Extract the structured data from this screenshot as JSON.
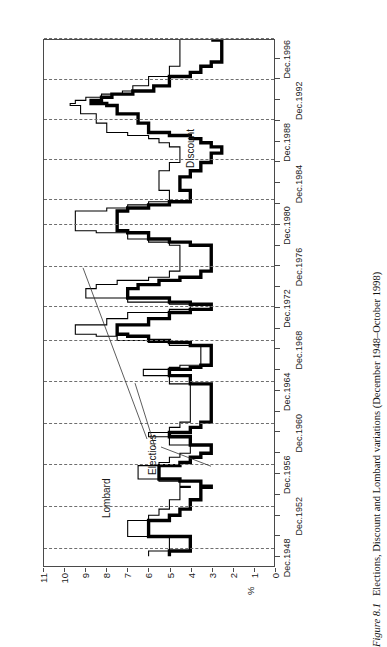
{
  "caption": {
    "figure_number": "Figure 8.1",
    "text": "Elections, Discount and Lombard variations (December 1948–October 1998)"
  },
  "annotations": {
    "lombard": "Lombard",
    "discount": "Discount",
    "elections": "Elections"
  },
  "chart_data": {
    "type": "line",
    "title": "Elections, Discount and Lombard variations (December 1948–October 1998)",
    "xlabel": "",
    "ylabel": "%",
    "ylim": [
      0,
      11
    ],
    "yticks": [
      "0",
      "1",
      "2",
      "3",
      "4",
      "5",
      "6",
      "7",
      "8",
      "9",
      "10",
      "11"
    ],
    "grid": "vertical-dashed-election-lines",
    "legend_position": "inline-annotations",
    "orientation": "page-rotated-90-ccw",
    "x_tick_labels": [
      "Dec.1948",
      "Dec.1952",
      "Dec.1956",
      "Dec.1960",
      "Dec.1964",
      "Dec.1968",
      "Dec.1972",
      "Dec.1976",
      "Dec.1980",
      "Dec.1984",
      "Dec.1988",
      "Dec.1992",
      "Dec.1996"
    ],
    "x_tick_years": [
      1948,
      1952,
      1956,
      1960,
      1964,
      1968,
      1972,
      1976,
      1980,
      1984,
      1988,
      1992,
      1996
    ],
    "x_minor_tick_years": [
      1950,
      1954,
      1958,
      1962,
      1966,
      1970,
      1974,
      1978,
      1982,
      1986,
      1990,
      1994,
      1998
    ],
    "xlim": [
      1948.0,
      1998.83
    ],
    "election_years": [
      1949.6,
      1953.7,
      1957.7,
      1961.7,
      1965.7,
      1969.7,
      1972.9,
      1976.8,
      1980.8,
      1983.2,
      1987.1,
      1990.9,
      1994.8,
      1998.75
    ],
    "series": [
      {
        "name": "Discount",
        "style": "thick-black-step",
        "points": [
          [
            1948.95,
            5.0
          ],
          [
            1949.45,
            4.0
          ],
          [
            1950.85,
            6.0
          ],
          [
            1952.4,
            5.0
          ],
          [
            1952.9,
            4.5
          ],
          [
            1953.5,
            4.0
          ],
          [
            1954.4,
            3.5
          ],
          [
            1955.6,
            3.0
          ],
          [
            1955.7,
            3.5
          ],
          [
            1956.2,
            4.5
          ],
          [
            1956.4,
            5.5
          ],
          [
            1957.7,
            4.5
          ],
          [
            1958.0,
            4.0
          ],
          [
            1958.5,
            3.5
          ],
          [
            1958.9,
            3.0
          ],
          [
            1959.7,
            4.0
          ],
          [
            1960.5,
            5.0
          ],
          [
            1960.9,
            4.0
          ],
          [
            1961.4,
            3.5
          ],
          [
            1961.9,
            3.0
          ],
          [
            1965.6,
            4.0
          ],
          [
            1966.4,
            5.0
          ],
          [
            1967.0,
            4.0
          ],
          [
            1967.2,
            3.5
          ],
          [
            1967.4,
            3.0
          ],
          [
            1969.3,
            4.0
          ],
          [
            1969.6,
            5.0
          ],
          [
            1969.8,
            6.0
          ],
          [
            1970.2,
            7.0
          ],
          [
            1970.4,
            7.5
          ],
          [
            1971.3,
            6.0
          ],
          [
            1971.9,
            5.0
          ],
          [
            1972.5,
            4.0
          ],
          [
            1972.8,
            3.0
          ],
          [
            1973.3,
            4.0
          ],
          [
            1973.5,
            5.0
          ],
          [
            1973.9,
            7.0
          ],
          [
            1974.8,
            6.5
          ],
          [
            1975.2,
            5.5
          ],
          [
            1975.6,
            4.5
          ],
          [
            1975.9,
            3.5
          ],
          [
            1976.5,
            3.0
          ],
          [
            1979.0,
            4.0
          ],
          [
            1979.3,
            5.0
          ],
          [
            1979.6,
            6.0
          ],
          [
            1980.2,
            7.0
          ],
          [
            1980.4,
            7.5
          ],
          [
            1982.3,
            7.0
          ],
          [
            1982.6,
            6.0
          ],
          [
            1982.9,
            5.0
          ],
          [
            1983.2,
            4.0
          ],
          [
            1984.3,
            4.5
          ],
          [
            1985.6,
            4.0
          ],
          [
            1986.2,
            3.5
          ],
          [
            1987.0,
            3.0
          ],
          [
            1987.9,
            2.5
          ],
          [
            1988.5,
            3.0
          ],
          [
            1988.9,
            3.5
          ],
          [
            1989.3,
            4.0
          ],
          [
            1989.6,
            5.0
          ],
          [
            1989.9,
            6.0
          ],
          [
            1990.8,
            6.5
          ],
          [
            1991.7,
            7.5
          ],
          [
            1992.5,
            8.0
          ],
          [
            1992.7,
            8.75
          ],
          [
            1993.0,
            8.25
          ],
          [
            1993.3,
            7.75
          ],
          [
            1993.6,
            6.75
          ],
          [
            1993.9,
            5.75
          ],
          [
            1994.4,
            5.0
          ],
          [
            1995.3,
            4.0
          ],
          [
            1995.7,
            3.5
          ],
          [
            1996.3,
            3.0
          ],
          [
            1996.7,
            2.5
          ],
          [
            1998.7,
            2.5
          ],
          [
            1998.83,
            3.0
          ]
        ]
      },
      {
        "name": "Lombard",
        "style": "thin-black-step",
        "points": [
          [
            1948.95,
            6.0
          ],
          [
            1949.45,
            5.0
          ],
          [
            1950.85,
            7.0
          ],
          [
            1952.4,
            6.0
          ],
          [
            1952.9,
            5.5
          ],
          [
            1953.5,
            5.0
          ],
          [
            1954.4,
            4.5
          ],
          [
            1955.6,
            4.0
          ],
          [
            1955.7,
            4.5
          ],
          [
            1956.2,
            5.5
          ],
          [
            1956.4,
            6.5
          ],
          [
            1957.7,
            5.5
          ],
          [
            1958.0,
            5.0
          ],
          [
            1958.5,
            4.5
          ],
          [
            1958.9,
            4.0
          ],
          [
            1959.7,
            5.0
          ],
          [
            1960.5,
            6.0
          ],
          [
            1960.9,
            5.0
          ],
          [
            1961.4,
            4.5
          ],
          [
            1961.9,
            4.0
          ],
          [
            1965.6,
            5.0
          ],
          [
            1966.4,
            6.25
          ],
          [
            1967.0,
            5.0
          ],
          [
            1967.2,
            4.5
          ],
          [
            1967.4,
            3.5
          ],
          [
            1969.3,
            5.0
          ],
          [
            1969.6,
            6.0
          ],
          [
            1969.8,
            7.5
          ],
          [
            1970.2,
            8.5
          ],
          [
            1970.4,
            9.5
          ],
          [
            1971.3,
            8.0
          ],
          [
            1971.9,
            7.0
          ],
          [
            1972.5,
            5.0
          ],
          [
            1972.8,
            4.0
          ],
          [
            1973.3,
            5.0
          ],
          [
            1973.5,
            7.0
          ],
          [
            1973.9,
            9.0
          ],
          [
            1974.8,
            8.5
          ],
          [
            1975.2,
            7.5
          ],
          [
            1975.6,
            6.0
          ],
          [
            1975.9,
            5.0
          ],
          [
            1976.5,
            4.5
          ],
          [
            1979.0,
            5.0
          ],
          [
            1979.3,
            6.0
          ],
          [
            1979.6,
            7.0
          ],
          [
            1980.2,
            8.5
          ],
          [
            1980.4,
            9.5
          ],
          [
            1982.3,
            8.0
          ],
          [
            1982.6,
            7.0
          ],
          [
            1982.9,
            6.0
          ],
          [
            1983.2,
            5.0
          ],
          [
            1984.3,
            5.5
          ],
          [
            1985.6,
            5.5
          ],
          [
            1986.2,
            5.0
          ],
          [
            1987.0,
            4.5
          ],
          [
            1987.9,
            4.5
          ],
          [
            1988.5,
            5.0
          ],
          [
            1988.9,
            5.5
          ],
          [
            1989.3,
            6.0
          ],
          [
            1989.6,
            7.0
          ],
          [
            1989.9,
            8.0
          ],
          [
            1990.8,
            8.5
          ],
          [
            1991.7,
            9.25
          ],
          [
            1992.5,
            9.75
          ],
          [
            1992.7,
            9.5
          ],
          [
            1993.0,
            9.0
          ],
          [
            1993.3,
            8.25
          ],
          [
            1993.6,
            7.25
          ],
          [
            1993.9,
            6.75
          ],
          [
            1994.4,
            6.0
          ],
          [
            1995.3,
            5.0
          ],
          [
            1995.7,
            5.0
          ],
          [
            1996.3,
            4.5
          ],
          [
            1996.7,
            4.5
          ],
          [
            1998.7,
            4.5
          ],
          [
            1998.83,
            4.5
          ]
        ]
      }
    ]
  }
}
